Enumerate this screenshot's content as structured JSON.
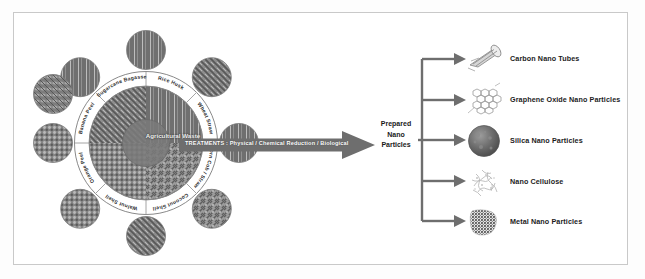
{
  "figure": {
    "center_hub": "Agricultural Waste",
    "treatments_banner": "TREATMENTS : Physical / Chemical Reduction / Biological",
    "prepared_label_line1": "Prepared",
    "prepared_label_line2": "Nano",
    "prepared_label_line3": "Particles",
    "colors": {
      "frame": "#c9c9c9",
      "arrow_gray": "#6e6e6e",
      "hub_gray": "#777777",
      "ring_stroke": "#8a8a8a",
      "text_dark": "#1c1c1c"
    }
  },
  "wheel": {
    "segments": [
      {
        "label": "Sugarcane Bagasse"
      },
      {
        "label": "Rice Husk"
      },
      {
        "label": "Wheat Straw"
      },
      {
        "label": "Corn Cob / Straw"
      },
      {
        "label": "Coconut Shell"
      },
      {
        "label": "Walnut Shell"
      },
      {
        "label": "Orange Peel"
      },
      {
        "label": "Banana Peel"
      }
    ]
  },
  "products": [
    {
      "label": "Carbon Nano Tubes",
      "icon": "carbon-nano-tube-icon"
    },
    {
      "label": "Graphene Oxide Nano Particles",
      "icon": "graphene-oxide-icon"
    },
    {
      "label": "Silica Nano Particles",
      "icon": "silica-sphere-icon"
    },
    {
      "label": "Nano Cellulose",
      "icon": "nano-cellulose-icon"
    },
    {
      "label": "Metal Nano Particles",
      "icon": "metal-nano-particles-icon"
    }
  ]
}
